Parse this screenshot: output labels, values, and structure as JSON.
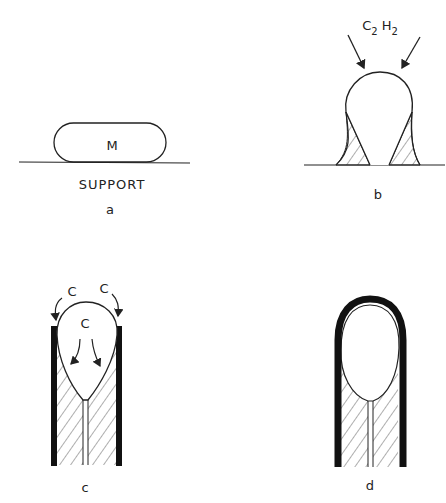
{
  "panels": {
    "a": {
      "caption": "a",
      "particle_label": "M",
      "surface_label": "SUPPORT"
    },
    "b": {
      "caption": "b",
      "gas_label": {
        "main": "C",
        "sub1": "2",
        "mid": "H",
        "sub2": "2"
      }
    },
    "c": {
      "caption": "c",
      "carbon_labels": [
        "C",
        "C",
        "C"
      ]
    },
    "d": {
      "caption": "d"
    }
  },
  "colors": {
    "ink": "#222222",
    "background": "#ffffff"
  }
}
